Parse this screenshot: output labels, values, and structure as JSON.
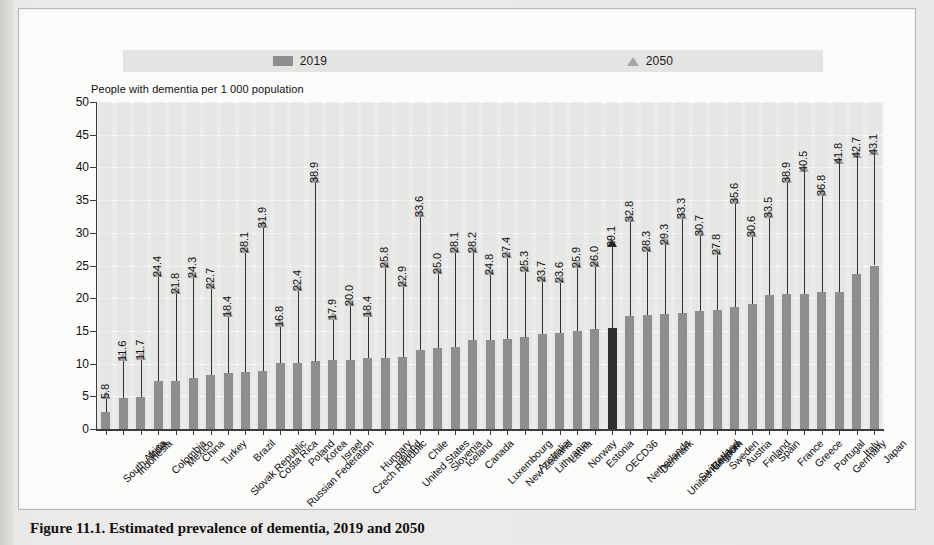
{
  "caption": "Figure 11.1. Estimated prevalence of dementia, 2019 and 2050",
  "legend": {
    "series_2019": "2019",
    "series_2050": "2050",
    "swatch_2019_color": "#8e8e8e",
    "marker_2050_color": "#a6a6a6"
  },
  "axis_title": "People with dementia per 1 000 population",
  "highlight_color": "#2f2f2f",
  "highlight_category": "OECD36",
  "chart_data": {
    "type": "bar",
    "title": "Estimated prevalence of dementia, 2019 and 2050",
    "xlabel": "",
    "ylabel": "People with dementia per 1 000 population",
    "ylim": [
      0,
      50
    ],
    "yticks": [
      0,
      5,
      10,
      15,
      20,
      25,
      30,
      35,
      40,
      45,
      50
    ],
    "grid": true,
    "legend_position": "top",
    "categories": [
      "South Africa",
      "Indonesia",
      "India",
      "Colombia",
      "Mexico",
      "China",
      "Turkey",
      "Slovak Republic",
      "Brazil",
      "Costa Rica",
      "Russian Federation",
      "Poland",
      "Korea",
      "Israel",
      "Czech Republic",
      "Hungary",
      "Ireland",
      "United States",
      "Chile",
      "Slovenia",
      "Iceland",
      "Canada",
      "Luxembourg",
      "New Zealand",
      "Australia",
      "Lithuania",
      "Latvia",
      "Norway",
      "Estonia",
      "OECD36",
      "Netherlands",
      "Denmark",
      "United Kingdom",
      "Switzerland",
      "Belgium",
      "Sweden",
      "Austria",
      "Finland",
      "Spain",
      "France",
      "Greece",
      "Portugal",
      "Germany",
      "Italy",
      "Japan"
    ],
    "series": [
      {
        "name": "2019",
        "values": [
          2.6,
          4.8,
          4.9,
          7.4,
          7.4,
          7.8,
          8.3,
          8.6,
          8.7,
          8.8,
          10.1,
          10.1,
          10.4,
          10.6,
          10.6,
          10.8,
          10.9,
          11.0,
          12.1,
          12.4,
          12.5,
          13.6,
          13.6,
          13.7,
          14.0,
          14.6,
          14.7,
          15.0,
          15.3,
          15.5,
          17.3,
          17.5,
          17.6,
          17.7,
          18.0,
          18.2,
          18.6,
          19.1,
          20.5,
          20.6,
          20.7,
          21.0,
          21.0,
          23.7,
          25.0
        ]
      },
      {
        "name": "2050",
        "values": [
          5.8,
          11.6,
          11.7,
          24.4,
          21.8,
          24.3,
          22.7,
          18.4,
          28.1,
          31.9,
          16.8,
          22.4,
          38.9,
          17.9,
          20.0,
          18.4,
          25.8,
          22.9,
          33.6,
          25.0,
          28.1,
          28.2,
          24.8,
          27.4,
          25.3,
          23.7,
          23.6,
          25.9,
          26.0,
          29.1,
          32.8,
          28.3,
          29.3,
          33.3,
          30.7,
          27.8,
          35.6,
          30.6,
          33.5,
          38.9,
          40.5,
          36.8,
          41.8,
          42.7,
          43.1
        ]
      }
    ],
    "labeled_points": {
      "note": "Each 2050 value is printed vertically above its arrow head.",
      "values": [
        "5.8",
        "11.6",
        "11.7",
        "24.4",
        "21.8",
        "24.3",
        "22.7",
        "18.4",
        "28.1",
        "31.9",
        "16.8",
        "22.4",
        "38.9",
        "17.9",
        "20.0",
        "18.4",
        "25.8",
        "22.9",
        "33.6",
        "25.0",
        "28.1",
        "28.2",
        "24.8",
        "27.4",
        "25.3",
        "23.7",
        "23.6",
        "25.9",
        "26.0",
        "29.1",
        "32.8",
        "28.3",
        "29.3",
        "33.3",
        "30.7",
        "27.8",
        "35.6",
        "30.6",
        "33.5",
        "38.9",
        "40.5",
        "36.8",
        "41.8",
        "42.7",
        "43.1"
      ]
    }
  }
}
